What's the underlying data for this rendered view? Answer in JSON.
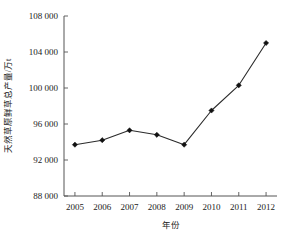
{
  "chart_data": {
    "type": "line",
    "title": "",
    "subtitle": "",
    "xlabel": "年份",
    "ylabel": "天然草原鲜草总产量/万t",
    "categories": [
      "2005",
      "2006",
      "2007",
      "2008",
      "2009",
      "2010",
      "2011",
      "2012"
    ],
    "x": [
      2005,
      2006,
      2007,
      2008,
      2009,
      2010,
      2011,
      2012
    ],
    "values": [
      93700,
      94200,
      95300,
      94800,
      93700,
      97500,
      100300,
      105000
    ],
    "series": [
      {
        "name": "天然草原鲜草总产量",
        "values": [
          93700,
          94200,
          95300,
          94800,
          93700,
          97500,
          100300,
          105000
        ]
      }
    ],
    "xlim": [
      2004.6,
      2012.4
    ],
    "ylim": [
      88000,
      108000
    ],
    "yticks": [
      88000,
      92000,
      96000,
      100000,
      104000,
      108000
    ],
    "ytick_labels": [
      "88 000",
      "92 000",
      "96 000",
      "100 000",
      "104 000",
      "108 000"
    ],
    "xticks": [
      2005,
      2006,
      2007,
      2008,
      2009,
      2010,
      2011,
      2012
    ],
    "xtick_labels": [
      "2005",
      "2006",
      "2007",
      "2008",
      "2009",
      "2010",
      "2011",
      "2012"
    ],
    "grid": false,
    "legend": "none",
    "marker": "filled-diamond",
    "line_color": "#2b2b2b",
    "marker_color": "#111111",
    "axis_color": "#555555",
    "background": "#ffffff"
  }
}
